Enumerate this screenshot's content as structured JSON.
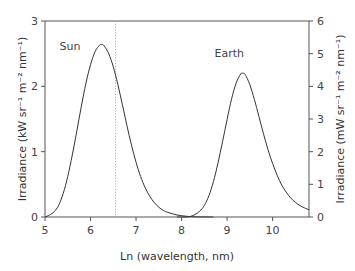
{
  "chart_data": {
    "type": "line",
    "title": "",
    "xlabel": "Ln (wavelength, nm)",
    "ylabel_left": "Irradiance (kW sr⁻¹ m⁻² nm⁻¹)",
    "ylabel_right": "Irradiance (mW sr⁻¹ m⁻² nm⁻¹)",
    "xlim": [
      5,
      10.8
    ],
    "ylim_left": [
      0,
      3
    ],
    "ylim_right": [
      0,
      6
    ],
    "x_ticks": [
      5,
      6,
      7,
      8,
      9,
      10
    ],
    "x_tick_labels": [
      "5",
      "6",
      "7",
      "8",
      "9",
      "10"
    ],
    "y_left_ticks": [
      0,
      1,
      2,
      3
    ],
    "y_left_tick_labels": [
      "0",
      "1",
      "2",
      "3"
    ],
    "y_right_ticks": [
      0,
      1,
      2,
      3,
      4,
      5,
      6
    ],
    "y_right_tick_labels": [
      "0",
      "1",
      "2",
      "3",
      "4",
      "5",
      "6"
    ],
    "grid": false,
    "vertical_reference_line": {
      "x": 6.55,
      "style": "dotted"
    },
    "annotations": [
      {
        "text": "Sun",
        "x": 5.55,
        "y_left": 2.55
      },
      {
        "text": "Earth",
        "x": 9.05,
        "y_left": 2.45
      }
    ],
    "series": [
      {
        "name": "Sun",
        "axis": "left",
        "x": [
          5.0,
          5.1,
          5.2,
          5.3,
          5.4,
          5.5,
          5.6,
          5.7,
          5.8,
          5.9,
          6.0,
          6.1,
          6.2,
          6.25,
          6.3,
          6.4,
          6.5,
          6.6,
          6.7,
          6.8,
          6.9,
          7.0,
          7.1,
          7.2,
          7.3,
          7.4,
          7.5,
          7.6,
          7.7,
          7.8,
          7.9,
          8.0,
          8.1,
          8.2,
          8.4,
          8.7
        ],
        "y": [
          0.0,
          0.03,
          0.08,
          0.18,
          0.36,
          0.62,
          0.95,
          1.32,
          1.7,
          2.05,
          2.33,
          2.53,
          2.63,
          2.64,
          2.62,
          2.5,
          2.3,
          2.03,
          1.72,
          1.4,
          1.1,
          0.84,
          0.62,
          0.45,
          0.32,
          0.22,
          0.15,
          0.1,
          0.07,
          0.05,
          0.03,
          0.02,
          0.012,
          0.006,
          0.002,
          0.0
        ]
      },
      {
        "name": "Earth",
        "axis": "right",
        "x": [
          7.9,
          8.0,
          8.1,
          8.2,
          8.3,
          8.4,
          8.5,
          8.6,
          8.7,
          8.8,
          8.9,
          9.0,
          9.1,
          9.2,
          9.3,
          9.35,
          9.4,
          9.5,
          9.6,
          9.7,
          9.8,
          9.9,
          10.0,
          10.1,
          10.2,
          10.3,
          10.4,
          10.5,
          10.6,
          10.7,
          10.8
        ],
        "y": [
          0.0,
          0.0,
          0.0,
          0.02,
          0.08,
          0.18,
          0.35,
          0.65,
          1.08,
          1.65,
          2.3,
          2.98,
          3.62,
          4.1,
          4.38,
          4.4,
          4.36,
          4.05,
          3.6,
          3.08,
          2.55,
          2.06,
          1.64,
          1.28,
          0.98,
          0.76,
          0.58,
          0.45,
          0.35,
          0.28,
          0.22
        ]
      }
    ]
  }
}
